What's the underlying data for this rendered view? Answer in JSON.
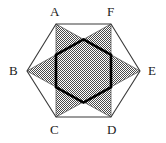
{
  "figure": {
    "name": "hexagram-in-hexagon",
    "caption": "",
    "colors": {
      "outline": "#3a3a3a",
      "star_fill": "#8a8a8a",
      "inner_hexagon_stroke": "#000000",
      "background": "#ffffff",
      "label_color": "#1a1a1a"
    },
    "outer_hexagon": {
      "stroke_width": 1,
      "vertices": [
        {
          "label": "A",
          "x": 56,
          "y": 24
        },
        {
          "label": "F",
          "x": 111,
          "y": 24
        },
        {
          "label": "E",
          "x": 140,
          "y": 71
        },
        {
          "label": "D",
          "x": 111,
          "y": 117
        },
        {
          "label": "C",
          "x": 56,
          "y": 117
        },
        {
          "label": "B",
          "x": 27,
          "y": 71
        }
      ]
    },
    "star": {
      "description": "hexagram formed by triangle A-E-C and triangle F-B-D",
      "fill_pattern": "50-percent-checkerboard-dither",
      "triangles": [
        {
          "name": "triangle-ACE",
          "points": "A,E,C"
        },
        {
          "name": "triangle-FBD",
          "points": "F,B,D"
        }
      ]
    },
    "inner_hexagon": {
      "stroke_width": 3,
      "description": "bold hexagon at the intersection of the two triangles"
    },
    "labels": [
      {
        "text": "A",
        "x": 50,
        "y": 6
      },
      {
        "text": "F",
        "x": 107,
        "y": 6
      },
      {
        "text": "B",
        "x": 9,
        "y": 64
      },
      {
        "text": "E",
        "x": 148,
        "y": 64
      },
      {
        "text": "C",
        "x": 50,
        "y": 124
      },
      {
        "text": "D",
        "x": 107,
        "y": 124
      }
    ]
  }
}
